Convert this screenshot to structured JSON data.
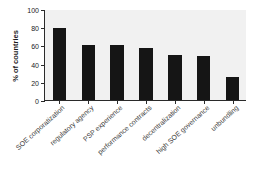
{
  "chart_data": {
    "type": "bar",
    "title": "",
    "subtitle": "",
    "xlabel": "",
    "ylabel": "% of countries",
    "ylim": [
      0,
      100
    ],
    "yticks": [
      0,
      20,
      40,
      60,
      80,
      100
    ],
    "ytick_labels": [
      "0",
      "20",
      "40",
      "60",
      "80",
      "100"
    ],
    "grid": false,
    "legend": null,
    "bar_color": "#151515",
    "plot_background": "#f1f1f1",
    "axis_color": "#2a2a2a",
    "categories": [
      "SOE corporatization",
      "regulatory agency",
      "PSP experience",
      "performance contracts",
      "decentralization",
      "high SOE governance",
      "unbundling"
    ],
    "values": [
      79,
      61,
      61,
      57,
      49,
      48,
      25
    ]
  }
}
